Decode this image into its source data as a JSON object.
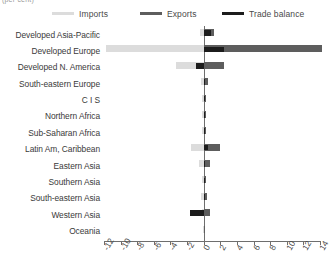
{
  "title_remnant": "(per cent)",
  "legend": {
    "items": [
      {
        "label": "Imports",
        "color": "#dcdcdc",
        "key": "imports"
      },
      {
        "label": "Exports",
        "color": "#5d5d5d",
        "key": "exports"
      },
      {
        "label": "Trade balance",
        "color": "#1c1c1c",
        "key": "balance"
      }
    ]
  },
  "chart_data": {
    "type": "bar",
    "orientation": "horizontal",
    "title": "",
    "subtitle": "",
    "xlabel": "",
    "ylabel": "",
    "xlim": [
      -12,
      14
    ],
    "xticks": [
      -12,
      -10,
      -8,
      -6,
      -4,
      -2,
      0,
      2,
      4,
      6,
      8,
      10,
      12,
      14
    ],
    "xticklabels": [
      "-12",
      "-10",
      "-8",
      "-6",
      "-4",
      "-2",
      "0",
      "2",
      "4",
      "6",
      "8",
      "10",
      "12",
      "14"
    ],
    "grid": false,
    "zero_line": true,
    "legend_position": "top",
    "categories": [
      "Developed Asia-Pacific",
      "Developed Europe",
      "Developed N. America",
      "South-eastern Europe",
      "C I S",
      "Northern Africa",
      "Sub-Saharan Africa",
      "Latin Am, Caribbean",
      "Eastern Asia",
      "Southern Asia",
      "South-eastern Asia",
      "Western Asia",
      "Oceania"
    ],
    "series": [
      {
        "name": "Imports",
        "color": "#dcdcdc",
        "values": [
          -0.45,
          -11.7,
          -3.3,
          -0.35,
          -0.2,
          -0.2,
          -0.2,
          -1.5,
          -0.55,
          -0.25,
          -0.3,
          -0.2,
          -0.05
        ]
      },
      {
        "name": "Exports",
        "color": "#5d5d5d",
        "values": [
          1.3,
          14.2,
          2.4,
          0.5,
          0.3,
          0.25,
          0.3,
          2.0,
          0.75,
          0.3,
          0.35,
          0.75,
          0.05
        ]
      },
      {
        "name": "Trade balance",
        "color": "#1c1c1c",
        "values": [
          0.85,
          2.5,
          -0.9,
          0.15,
          0.1,
          0.05,
          0.1,
          0.5,
          0.2,
          0.05,
          0.05,
          -1.7,
          0.0
        ]
      }
    ]
  }
}
